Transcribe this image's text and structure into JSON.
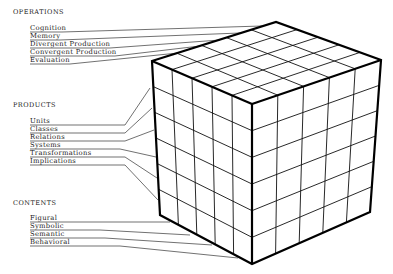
{
  "diagram": {
    "operations": {
      "header": "OPERATIONS",
      "items": [
        "Cognition",
        "Memory",
        "Divergent Production",
        "Convergent Production",
        "Evaluation"
      ]
    },
    "products": {
      "header": "PRODUCTS",
      "items": [
        "Units",
        "Classes",
        "Relations",
        "Systems",
        "Transformations",
        "Implications"
      ]
    },
    "contents": {
      "header": "CONTENTS",
      "items": [
        "Figural",
        "Symbolic",
        "Semantic",
        "Behavioral"
      ]
    },
    "cube": {
      "top_grid": [
        5,
        5
      ],
      "left_face_grid": [
        5,
        6
      ],
      "right_face_grid": [
        5,
        6
      ],
      "line_color": "#111111"
    }
  }
}
